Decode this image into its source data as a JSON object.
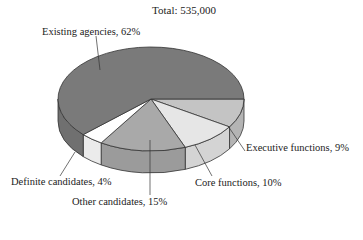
{
  "chart_data": {
    "type": "pie",
    "title": "Total: 535,000",
    "style": "3d",
    "categories": [
      "Existing agencies",
      "Executive functions",
      "Core functions",
      "Other candidates",
      "Definite candidates"
    ],
    "values": [
      62,
      9,
      10,
      15,
      4
    ],
    "unit": "%",
    "labels": [
      "Existing agencies, 62%",
      "Executive functions, 9%",
      "Core functions, 10%",
      "Other candidates, 15%",
      "Definite candidates, 4%"
    ],
    "colors": [
      "#7a7a7a",
      "#c4c4c4",
      "#e6e6e6",
      "#a9a9a9",
      "#ffffff"
    ],
    "legend": "none (leader-line labels)"
  }
}
